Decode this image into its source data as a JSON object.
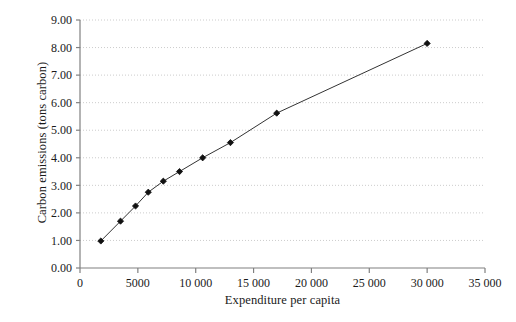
{
  "chart_data": {
    "type": "line",
    "title": "",
    "subtitle": "",
    "xlabel": "Expenditure per capita",
    "ylabel": "Carbon emissions (tons carbon)",
    "xlim": [
      0,
      35000
    ],
    "ylim": [
      0.0,
      9.0
    ],
    "xticks": [
      0,
      5000,
      10000,
      15000,
      20000,
      25000,
      30000,
      35000
    ],
    "xtick_labels": [
      "0",
      "5000",
      "10 000",
      "15 000",
      "20 000",
      "25 000",
      "30 000",
      "35 000"
    ],
    "yticks": [
      0,
      1,
      2,
      3,
      4,
      5,
      6,
      7,
      8,
      9
    ],
    "ytick_labels": [
      "0.00",
      "1.00",
      "2.00",
      "3.00",
      "4.00",
      "5.00",
      "6.00",
      "7.00",
      "8.00",
      "9.00"
    ],
    "grid": "horizontal-dotted",
    "legend": "none",
    "marker": "filled-diamond",
    "line_color": "#333333",
    "marker_color": "#111111",
    "grid_color": "#cccccc",
    "axis_color": "#808080",
    "series": [
      {
        "name": "Carbon emissions vs expenditure",
        "x": [
          1800,
          3500,
          4800,
          5900,
          7200,
          8600,
          10600,
          13000,
          17000,
          30000
        ],
        "y": [
          0.98,
          1.7,
          2.25,
          2.75,
          3.15,
          3.5,
          4.0,
          4.55,
          5.62,
          8.15
        ]
      }
    ]
  },
  "figure": {
    "background": "#ffffff",
    "width": 516,
    "height": 322
  }
}
